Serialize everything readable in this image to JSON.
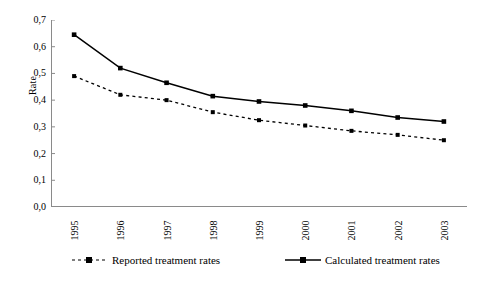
{
  "chart_data": {
    "type": "line",
    "title": "",
    "xlabel": "",
    "ylabel": "Rate",
    "categories": [
      "1995",
      "1996",
      "1997",
      "1998",
      "1999",
      "2000",
      "2001",
      "2002",
      "2003"
    ],
    "ylim": [
      0.0,
      0.7
    ],
    "ytick_labels": [
      "0,0",
      "0,1",
      "0,2",
      "0,3",
      "0,4",
      "0,5",
      "0,6",
      "0,7"
    ],
    "ytick_values": [
      0.0,
      0.1,
      0.2,
      0.3,
      0.4,
      0.5,
      0.6,
      0.7
    ],
    "grid": false,
    "legend_position": "bottom",
    "decimal_separator": ",",
    "series": [
      {
        "name": "Reported treatment rates",
        "style": "dashed",
        "marker": "square",
        "color": "#000000",
        "values": [
          0.49,
          0.42,
          0.4,
          0.355,
          0.325,
          0.305,
          0.285,
          0.27,
          0.25
        ]
      },
      {
        "name": "Calculated treatment rates",
        "style": "solid",
        "marker": "square",
        "color": "#000000",
        "values": [
          0.645,
          0.52,
          0.465,
          0.415,
          0.395,
          0.38,
          0.36,
          0.335,
          0.32
        ]
      }
    ]
  },
  "axis": {
    "y_label": "Rate"
  },
  "legend": {
    "entries": [
      {
        "label": "Reported treatment rates"
      },
      {
        "label": "Calculated treatment rates"
      }
    ]
  }
}
